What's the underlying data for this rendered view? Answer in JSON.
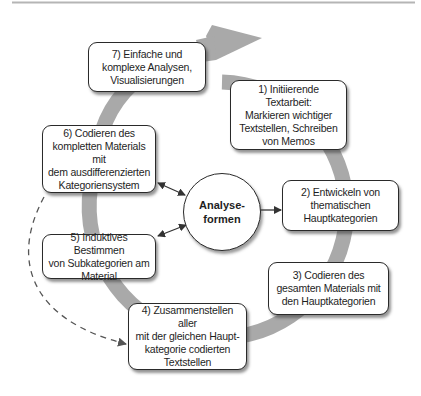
{
  "diagram": {
    "center": {
      "label": "Analyse-\nformen"
    },
    "steps": [
      {
        "id": 1,
        "label": "1) Initiierende Textarbeit:\nMarkieren wichtiger\nTextstellen, Schreiben\nvon Memos"
      },
      {
        "id": 2,
        "label": "2) Entwickeln von\nthematischen\nHauptkategorien"
      },
      {
        "id": 3,
        "label": "3) Codieren des\ngesamten Materials mit\nden Hauptkategorien"
      },
      {
        "id": 4,
        "label": "4) Zusammenstellen aller\nmit der gleichen Haupt-\nkategorie codierten\nTextstellen"
      },
      {
        "id": 5,
        "label": "5) Induktives Bestimmen\nvon Subkategorien am\nMaterial"
      },
      {
        "id": 6,
        "label": "6) Codieren des\nkompletten Materials mit\ndem ausdifferenzierten\nKategoriensystem"
      },
      {
        "id": 7,
        "label": "7) Einfache und\nkomplexe Analysen,\nVisualisierungen"
      }
    ],
    "connections": [
      {
        "from": "center",
        "to": "2",
        "type": "arrow"
      },
      {
        "from": "center",
        "to": "6",
        "type": "bidirectional"
      },
      {
        "from": "center",
        "to": "5",
        "type": "bidirectional"
      },
      {
        "from": "6",
        "to": "4",
        "type": "dashed-arrow"
      }
    ],
    "colors": {
      "ring": "#a9a9a9",
      "border": "#2a2a2a",
      "text": "#1e1e1e",
      "rule": "#b5b5b5"
    }
  }
}
